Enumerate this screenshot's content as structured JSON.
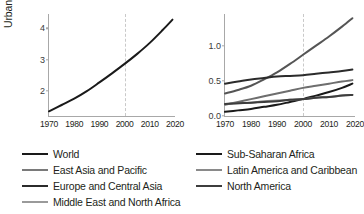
{
  "chart_data": [
    {
      "id": "left",
      "type": "line",
      "title": "",
      "xlabel": "",
      "ylabel": "Urban population (billion)",
      "xlim": [
        1970,
        2020
      ],
      "ylim": [
        1.2,
        4.45
      ],
      "yticks": [
        2,
        3,
        4
      ],
      "ytick_labels": [
        "2",
        "3",
        "4"
      ],
      "xticks": [
        1970,
        1980,
        1990,
        2000,
        2010,
        2020
      ],
      "xtick_labels": [
        "1970",
        "1980",
        "1990",
        "2000",
        "2010",
        "2020"
      ],
      "grid": false,
      "annotations": [
        {
          "type": "vline",
          "x": 2000,
          "style": "dashed",
          "color": "#c9c9c9"
        }
      ],
      "legend_position": "below",
      "x": [
        1970,
        1975,
        1980,
        1985,
        1990,
        1995,
        2000,
        2005,
        2010,
        2015,
        2019
      ],
      "series": [
        {
          "name": "World",
          "color": "#1a1a1a",
          "width": 2.0,
          "values": [
            1.35,
            1.55,
            1.75,
            1.99,
            2.27,
            2.56,
            2.86,
            3.18,
            3.53,
            3.93,
            4.27
          ]
        }
      ]
    },
    {
      "id": "right",
      "type": "line",
      "title": "",
      "xlabel": "",
      "ylabel": "",
      "xlim": [
        1970,
        2020
      ],
      "ylim": [
        0.0,
        1.45
      ],
      "yticks": [
        0.0,
        0.5,
        1.0
      ],
      "ytick_labels": [
        "0.0",
        "0.5",
        "1.0"
      ],
      "xticks": [
        1970,
        1980,
        1990,
        2000,
        2010,
        2020
      ],
      "xtick_labels": [
        "1970",
        "1980",
        "1990",
        "2000",
        "2010",
        "2020"
      ],
      "grid": false,
      "annotations": [
        {
          "type": "vline",
          "x": 2000,
          "style": "dashed",
          "color": "#c9c9c9"
        }
      ],
      "legend_position": "below",
      "x": [
        1970,
        1975,
        1980,
        1985,
        1990,
        1995,
        2000,
        2005,
        2010,
        2015,
        2019
      ],
      "series": [
        {
          "name": "East Asia and Pacific",
          "color": "#555555",
          "width": 2.0,
          "values": [
            0.32,
            0.37,
            0.43,
            0.52,
            0.62,
            0.74,
            0.87,
            1.0,
            1.13,
            1.27,
            1.39
          ]
        },
        {
          "name": "Europe and Central Asia",
          "color": "#2b2b2b",
          "width": 2.0,
          "values": [
            0.46,
            0.49,
            0.52,
            0.54,
            0.56,
            0.57,
            0.58,
            0.6,
            0.62,
            0.64,
            0.66
          ]
        },
        {
          "name": "Latin America and Caribbean",
          "color": "#6e6e6e",
          "width": 2.0,
          "values": [
            0.16,
            0.2,
            0.24,
            0.28,
            0.32,
            0.36,
            0.4,
            0.43,
            0.46,
            0.49,
            0.51
          ]
        },
        {
          "name": "Sub-Saharan Africa",
          "color": "#1a1a1a",
          "width": 2.0,
          "values": [
            0.06,
            0.08,
            0.1,
            0.13,
            0.16,
            0.2,
            0.24,
            0.29,
            0.34,
            0.4,
            0.46
          ]
        },
        {
          "name": "Middle East and North Africa",
          "color": "#8a8a8a",
          "width": 2.0,
          "values": [
            0.17,
            0.18,
            0.19,
            0.21,
            0.22,
            0.23,
            0.24,
            0.26,
            0.27,
            0.29,
            0.3
          ]
        },
        {
          "name": "North America",
          "color": "#3d3d3d",
          "width": 2.0,
          "values": [
            0.17,
            0.18,
            0.19,
            0.2,
            0.21,
            0.23,
            0.24,
            0.26,
            0.27,
            0.29,
            0.3
          ]
        }
      ]
    }
  ],
  "legend": {
    "left_column": [
      {
        "label": "World",
        "color": "#1a1a1a",
        "width": 2.6
      },
      {
        "label": "East Asia and Pacific",
        "color": "#7a7a7a",
        "width": 2.0
      },
      {
        "label": "Europe and Central Asia",
        "color": "#2b2b2b",
        "width": 2.2
      },
      {
        "label": "Middle East and North Africa",
        "color": "#9a9a9a",
        "width": 2.0
      }
    ],
    "right_column": [
      {
        "label": "Sub-Saharan Africa",
        "color": "#1a1a1a",
        "width": 2.4
      },
      {
        "label": "Latin America and Caribbean",
        "color": "#8a8a8a",
        "width": 2.0
      },
      {
        "label": "North America",
        "color": "#3d3d3d",
        "width": 2.4
      }
    ]
  }
}
